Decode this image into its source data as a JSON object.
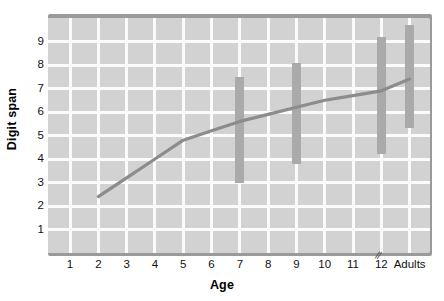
{
  "chart_data": {
    "type": "line",
    "title": "",
    "xlabel": "Age",
    "ylabel": "Digit span",
    "categories": [
      "1",
      "2",
      "3",
      "4",
      "5",
      "6",
      "7",
      "8",
      "9",
      "10",
      "11",
      "12",
      "Adults"
    ],
    "ytick_labels": [
      "1",
      "2",
      "3",
      "4",
      "5",
      "6",
      "7",
      "8",
      "9"
    ],
    "ylim": [
      0,
      10
    ],
    "xtick_labels": [
      "1",
      "2",
      "3",
      "4",
      "5",
      "6",
      "7",
      "8",
      "9",
      "10",
      "11",
      "12",
      "Adults"
    ],
    "axis_break_marker": "//",
    "grid": true,
    "legend": "none",
    "series": [
      {
        "name": "Mean digit span",
        "type": "line",
        "x": [
          "2",
          "3",
          "4",
          "5",
          "6",
          "7",
          "8",
          "9",
          "10",
          "11",
          "12",
          "Adults"
        ],
        "values": [
          2.4,
          3.2,
          4.0,
          4.8,
          5.2,
          5.6,
          5.9,
          6.2,
          6.5,
          6.7,
          6.9,
          7.4
        ]
      },
      {
        "name": "Range bars",
        "type": "range",
        "x": [
          "7",
          "9",
          "12",
          "Adults"
        ],
        "low": [
          3.0,
          3.8,
          4.2,
          5.3
        ],
        "high": [
          7.5,
          8.1,
          9.2,
          9.7
        ]
      }
    ],
    "colors": {
      "plot_background": "#d2d2d2",
      "gridline": "#fbfbfb",
      "bar": "#aaaaaa",
      "line": "#8c8c8c",
      "frame_shadow": "#9a9a9a",
      "text": "#111111"
    }
  }
}
